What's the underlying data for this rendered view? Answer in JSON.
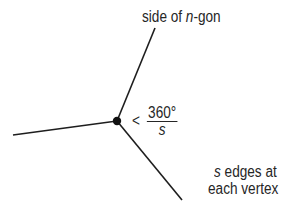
{
  "diagram": {
    "labels": {
      "polygon_side": {
        "prefix": "side of ",
        "variable": "n",
        "suffix": "-gon"
      },
      "angle": {
        "relation": "<",
        "numerator": "360°",
        "denominator": "s"
      },
      "edges_note": {
        "variable": "s",
        "line1_rest": " edges at",
        "line2": "each vertex"
      }
    },
    "elements": {
      "vertex": "vertex-dot",
      "edges": [
        "edge-left",
        "edge-upper",
        "edge-lower-right"
      ]
    },
    "colors": {
      "line": "#1e1e1e",
      "text": "#262626",
      "background": "#ffffff"
    }
  }
}
